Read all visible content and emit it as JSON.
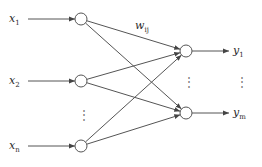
{
  "diagram": {
    "title": "",
    "type": "single-layer neural network",
    "colors": {
      "line": "#555555",
      "text": "#2a2a2a",
      "background": "#ffffff"
    },
    "inputs": [
      {
        "id": "x1",
        "label": "x",
        "sub": "1",
        "x": 81,
        "y": 19
      },
      {
        "id": "x2",
        "label": "x",
        "sub": "2",
        "x": 81,
        "y": 81
      },
      {
        "id": "xn",
        "label": "x",
        "sub": "n",
        "x": 81,
        "y": 146
      }
    ],
    "outputs": [
      {
        "id": "y1",
        "label": "y",
        "sub": "1",
        "x": 186,
        "y": 51
      },
      {
        "id": "ym",
        "label": "y",
        "sub": "m",
        "x": 186,
        "y": 113
      }
    ],
    "weight_label": {
      "label": "w",
      "sub": "ij"
    },
    "input_ellipsis": "⋮",
    "output_ellipsis": "⋮",
    "output_label_ellipsis": "⋮",
    "edges": [
      [
        "x1",
        "y1"
      ],
      [
        "x1",
        "ym"
      ],
      [
        "x2",
        "y1"
      ],
      [
        "x2",
        "ym"
      ],
      [
        "xn",
        "y1"
      ],
      [
        "xn",
        "ym"
      ]
    ]
  }
}
